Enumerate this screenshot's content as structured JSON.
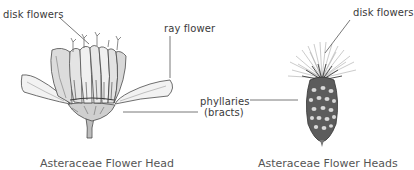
{
  "left_figure": {
    "labels": {
      "disk_flowers": "disk flowers",
      "ray_flower": "ray flower"
    },
    "caption": "Asteraceae Flower Head"
  },
  "shared_labels": {
    "phyllaries": "phyllaries",
    "bracts": "(bracts)"
  },
  "right_figure": {
    "labels": {
      "disk_flowers": "disk flowers"
    },
    "caption": "Asteraceae Flower Heads"
  },
  "colors": {
    "line": "#555555",
    "ink": "#3a3a3a",
    "background": "#ffffff"
  }
}
